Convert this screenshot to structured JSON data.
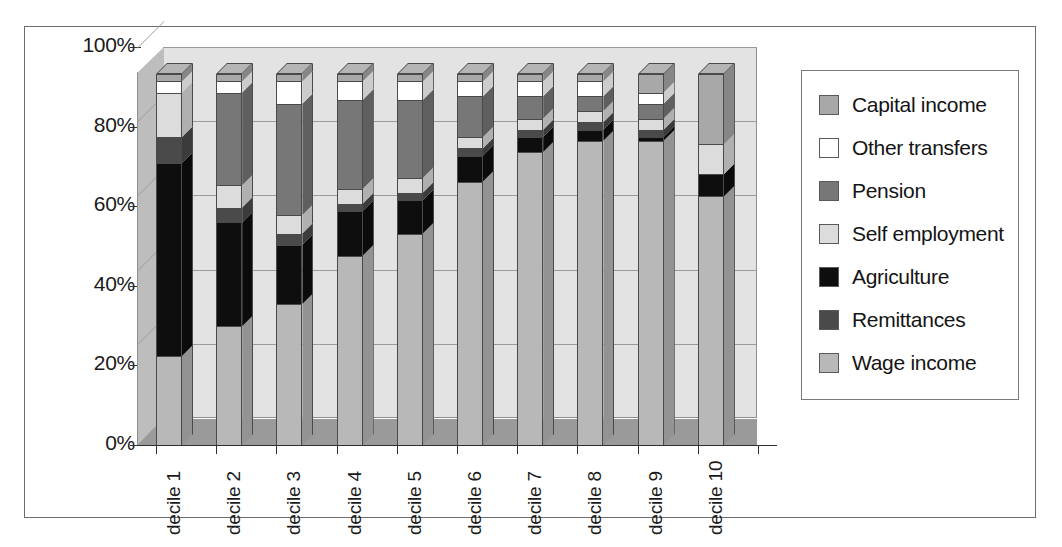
{
  "chart_data": {
    "type": "bar",
    "subtype": "stacked-100-percent-3d",
    "title": "",
    "xlabel": "",
    "ylabel": "",
    "ylim": [
      0,
      100
    ],
    "ytick_labels": [
      "0%",
      "20%",
      "40%",
      "60%",
      "80%",
      "100%"
    ],
    "ytick_values": [
      0,
      20,
      40,
      60,
      80,
      100
    ],
    "grid": true,
    "legend_position": "right",
    "categories": [
      "decile 1",
      "decile 2",
      "decile 3",
      "decile 4",
      "decile 5",
      "decile 6",
      "decile 7",
      "decile 8",
      "decile 9",
      "decile 10"
    ],
    "series": [
      {
        "name": "Wage income",
        "color": "#b8b8b8",
        "values": [
          24,
          32,
          38,
          51,
          57,
          71,
          79,
          82,
          82,
          67
        ]
      },
      {
        "name": "Remittances",
        "color": "#4a4a4a",
        "values": [
          7,
          4,
          3,
          2,
          2,
          2,
          2,
          2,
          2,
          0
        ]
      },
      {
        "name": "Agriculture",
        "color": "#0e0e0e",
        "values": [
          52,
          28,
          16,
          12,
          9,
          7,
          4,
          3,
          1,
          6
        ]
      },
      {
        "name": "Self employment",
        "color": "#dcdcdc",
        "values": [
          12,
          6,
          5,
          4,
          4,
          3,
          3,
          3,
          3,
          8
        ]
      },
      {
        "name": "Pension",
        "color": "#777777",
        "values": [
          0,
          25,
          30,
          24,
          21,
          11,
          6,
          4,
          4,
          0
        ]
      },
      {
        "name": "Other transfers",
        "color": "#ffffff",
        "values": [
          3,
          3,
          6,
          5,
          5,
          4,
          4,
          4,
          3,
          0
        ]
      },
      {
        "name": "Capital income",
        "color": "#a8a8a8",
        "values": [
          2,
          2,
          2,
          2,
          2,
          2,
          2,
          2,
          5,
          19
        ]
      }
    ],
    "stack_order_bottom_to_top": [
      "Wage income",
      "Agriculture",
      "Remittances",
      "Self employment",
      "Pension",
      "Other transfers",
      "Capital income"
    ]
  },
  "legend": {
    "items": [
      {
        "label": "Capital income",
        "color": "#a8a8a8"
      },
      {
        "label": "Other transfers",
        "color": "#ffffff"
      },
      {
        "label": "Pension",
        "color": "#777777"
      },
      {
        "label": "Self employment",
        "color": "#dcdcdc"
      },
      {
        "label": "Agriculture",
        "color": "#0e0e0e"
      },
      {
        "label": "Remittances",
        "color": "#4a4a4a"
      },
      {
        "label": "Wage income",
        "color": "#b8b8b8"
      }
    ]
  },
  "palette": {
    "back_wall": "#e3e3e3",
    "side_wall": "#bdbdbd",
    "floor": "#9a9a9a",
    "gridline": "#9b9b9b",
    "outline": "#4a4a4a",
    "frame": "#6d6d6d",
    "text": "#1a1a1a",
    "background": "#ffffff"
  }
}
